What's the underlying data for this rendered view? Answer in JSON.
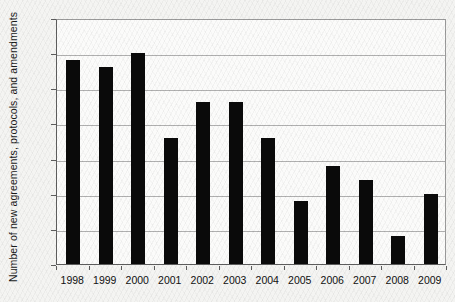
{
  "chart_data": {
    "type": "bar",
    "title": "",
    "xlabel": "",
    "ylabel": "Number of new agreements, protocols, and amendments",
    "categories": [
      "1998",
      "1999",
      "2000",
      "2001",
      "2002",
      "2003",
      "2004",
      "2005",
      "2006",
      "2007",
      "2008",
      "2009"
    ],
    "values": [
      29,
      28,
      30,
      18,
      23,
      23,
      18,
      9,
      14,
      12,
      4,
      10
    ],
    "ylim": [
      0,
      35
    ],
    "yticks": [
      0,
      5,
      10,
      15,
      20,
      25,
      30,
      35
    ],
    "ytick_labels": [
      "0",
      "5",
      "10",
      "15",
      "20",
      "25",
      "30",
      "35"
    ],
    "grid": true,
    "grid_axis": "y",
    "legend": null,
    "bar_color": "#0a0a0a",
    "gridline_color": "#b0b0b0",
    "axis_color": "#5d5d5d",
    "plot_background": "#fbfbfa",
    "page_background": "#f4f4f2"
  }
}
